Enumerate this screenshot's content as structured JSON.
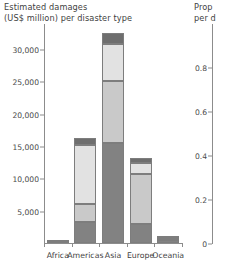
{
  "left": {
    "title_line1": "Estimated damages",
    "title_line2": "(US$ million) per disaster type"
  },
  "right": {
    "title_line1": "Prop",
    "title_line2": "per d"
  },
  "chart_data": [
    {
      "type": "bar",
      "stacked": true,
      "title": "Estimated damages (US$ million) per disaster type",
      "xlabel": "",
      "ylabel": "Estimated damages (US$ million)",
      "categories": [
        "Africa",
        "Americas",
        "Asia",
        "Europe",
        "Oceania"
      ],
      "ylim": [
        0,
        34000
      ],
      "yticks": [
        5000,
        10000,
        15000,
        20000,
        25000,
        30000
      ],
      "ytick_labels": [
        "5,000",
        "10,000",
        "15,000",
        "20,000",
        "25,000",
        "30,000"
      ],
      "grid": false,
      "legend_position": "none",
      "series": [
        {
          "name": "series-1-dark-base",
          "color": "#828282",
          "values": [
            120,
            3300,
            15400,
            2900,
            420
          ]
        },
        {
          "name": "series-2-light-mid",
          "color": "#c9c9c9",
          "values": [
            70,
            2800,
            9700,
            7800,
            250
          ]
        },
        {
          "name": "series-3-very-light",
          "color": "#e2e2e2",
          "values": [
            40,
            9100,
            5600,
            1700,
            90
          ]
        },
        {
          "name": "series-4-dark-top",
          "color": "#6e6e6e",
          "values": [
            20,
            1000,
            1800,
            700,
            60
          ]
        }
      ],
      "totals": [
        250,
        16200,
        32500,
        13100,
        820
      ]
    },
    {
      "type": "bar",
      "stacked": true,
      "cropped": true,
      "title": "Prop per d",
      "ylim": [
        0,
        1
      ],
      "yticks": [
        0,
        0.2,
        0.4,
        0.6,
        0.8
      ],
      "ytick_labels": [
        "0",
        "0.2",
        "0.4",
        "0.6",
        "0.8"
      ],
      "categories": [],
      "series": [],
      "grid": false,
      "legend_position": "none"
    }
  ]
}
